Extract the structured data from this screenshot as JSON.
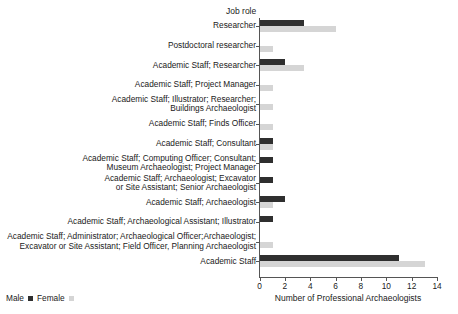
{
  "chart_data": {
    "type": "bar",
    "orientation": "horizontal",
    "title": "",
    "ylabel": "Job role",
    "xlabel": "Number of Professional Archaeologists",
    "xlim": [
      0,
      14
    ],
    "xticks": [
      0,
      2,
      4,
      6,
      8,
      10,
      12,
      14
    ],
    "grid": false,
    "legend_position": "bottom-left",
    "categories": [
      "Researcher",
      "Postdoctoral researcher",
      "Academic Staff; Researcher",
      "Academic Staff; Project Manager",
      "Academic Staff; Illustrator; Researcher;\nBuildings Archaeologist",
      "Academic Staff; Finds Officer",
      "Academic Staff; Consultant",
      "Academic Staff; Computing Officer; Consultant;\nMuseum Archaeologist; Project Manager",
      "Academic Staff; Archaeologist; Excavator\nor Site Assistant; Senior Archaeologist",
      "Academic Staff; Archaeologist",
      "Academic Staff; Archaeological Assistant; Illustrator",
      "Academic Staff; Administrator; Archaeological Officer;Archaeologist;\nExcavator or Site Assistant; Field Officer, Planning Archaeologist",
      "Academic Staff"
    ],
    "series": [
      {
        "name": "Male",
        "color": "#2f2f2f",
        "values": [
          3.5,
          0,
          2,
          0,
          0,
          0,
          1,
          1,
          1,
          2,
          1,
          0,
          11
        ]
      },
      {
        "name": "Female",
        "color": "#d5d5d5",
        "values": [
          6,
          1,
          3.5,
          1,
          1,
          1,
          1,
          0,
          0,
          1,
          0,
          1,
          13
        ]
      }
    ]
  },
  "legend": {
    "label_male": "Male",
    "label_female": "Female"
  }
}
